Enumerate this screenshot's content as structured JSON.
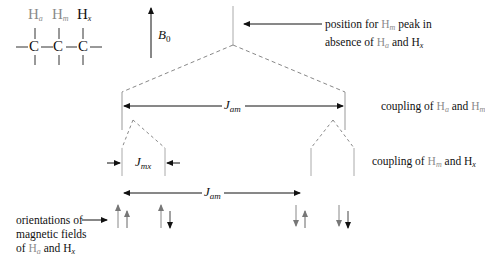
{
  "molecule": {
    "atoms": [
      "C",
      "C",
      "C"
    ],
    "hydrogens": [
      {
        "label": "H",
        "sub": "a",
        "color": "#8a8a8a"
      },
      {
        "label": "H",
        "sub": "m",
        "color": "#8a8a8a"
      },
      {
        "label": "H",
        "sub": "x",
        "color": "#111111"
      }
    ]
  },
  "field": {
    "label": "B",
    "sub": "0"
  },
  "annotations": {
    "position_line1_pre": "position for ",
    "position_line1_h": "H",
    "position_line1_hsub": "m",
    "position_line1_post": " peak in",
    "position_line2_pre": "absence of ",
    "position_line2_h1": "H",
    "position_line2_h1sub": "a",
    "position_line2_mid": " and ",
    "position_line2_h2": "H",
    "position_line2_h2sub": "x",
    "coupling1_pre": "coupling of ",
    "coupling1_h1": "H",
    "coupling1_h1sub": "a",
    "coupling1_mid": " and ",
    "coupling1_h2": "H",
    "coupling1_h2sub": "m",
    "coupling2_pre": "coupling of ",
    "coupling2_h1": "H",
    "coupling2_h1sub": "m",
    "coupling2_mid": " and ",
    "coupling2_h2": "H",
    "coupling2_h2sub": "x",
    "orient_line1": "orientations of",
    "orient_line2": "magnetic fields",
    "orient_line3_pre": "of ",
    "orient_line3_h1": "H",
    "orient_line3_h1sub": "a",
    "orient_line3_mid": " and ",
    "orient_line3_h2": "H",
    "orient_line3_h2sub": "x"
  },
  "constants": {
    "j_am": {
      "label": "J",
      "sub": "am"
    },
    "j_mx": {
      "label": "J",
      "sub": "mx"
    },
    "j_am2": {
      "label": "J",
      "sub": "am"
    }
  },
  "spin_pairs": [
    {
      "a": "up",
      "x": "up"
    },
    {
      "a": "up",
      "x": "down"
    },
    {
      "a": "down",
      "x": "up"
    },
    {
      "a": "down",
      "x": "down"
    }
  ],
  "colors": {
    "line": "#9a9a9a",
    "ink": "#111111",
    "ha_hm": "#8a8a8a"
  }
}
